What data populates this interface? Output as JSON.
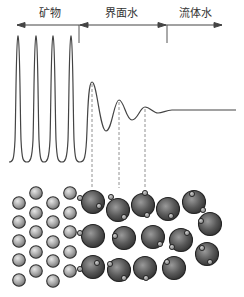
{
  "labels": {
    "mineral": "矿物",
    "interfacial_water": "界面水",
    "fluid_water": "流体水"
  },
  "colors": {
    "line": "#444444",
    "dash": "#777777",
    "small_sphere_fill": "#a9a9a9",
    "large_sphere_fill": "#555555",
    "sphere_outline": "#2a2a2a"
  },
  "arrows": [
    {
      "from": 79,
      "to": 17,
      "y": 25,
      "direction": "left"
    },
    {
      "from": 79,
      "to": 167,
      "y": 25,
      "direction": "left-right-boundary"
    },
    {
      "from": 167,
      "to": 222,
      "y": 25,
      "direction": "right"
    }
  ],
  "dividers": [
    {
      "x": 79,
      "y1": 25,
      "y2": 43
    },
    {
      "x": 167,
      "y1": 25,
      "y2": 43
    }
  ],
  "density_curve": {
    "description": "Density profile: four sharp mineral peaks, then damped oscillation of interfacial water, then flat fluid water",
    "mineral_peaks_x": [
      18,
      36,
      53,
      71
    ],
    "peak_top_y": 36,
    "baseline_y": 162,
    "water_peaks": [
      {
        "x": 92,
        "y": 82
      },
      {
        "x": 119,
        "y": 100
      },
      {
        "x": 145,
        "y": 107
      }
    ],
    "water_troughs": [
      {
        "x": 107,
        "y": 131
      },
      {
        "x": 132,
        "y": 120
      },
      {
        "x": 159,
        "y": 113
      }
    ],
    "flat_y": 110,
    "flat_end_x": 236
  },
  "dashed_guides_x": [
    92,
    119,
    145
  ],
  "small_spheres": [
    {
      "x": 19,
      "y": 203
    },
    {
      "x": 19,
      "y": 222
    },
    {
      "x": 19,
      "y": 241
    },
    {
      "x": 19,
      "y": 260
    },
    {
      "x": 19,
      "y": 280
    },
    {
      "x": 36,
      "y": 193
    },
    {
      "x": 36,
      "y": 213
    },
    {
      "x": 36,
      "y": 232
    },
    {
      "x": 36,
      "y": 252
    },
    {
      "x": 36,
      "y": 271
    },
    {
      "x": 53,
      "y": 203
    },
    {
      "x": 53,
      "y": 222
    },
    {
      "x": 53,
      "y": 242
    },
    {
      "x": 53,
      "y": 261
    },
    {
      "x": 53,
      "y": 281
    },
    {
      "x": 70,
      "y": 193
    },
    {
      "x": 70,
      "y": 213
    },
    {
      "x": 70,
      "y": 232
    },
    {
      "x": 70,
      "y": 252
    },
    {
      "x": 70,
      "y": 271
    }
  ],
  "large_spheres": [
    {
      "x": 93,
      "y": 202,
      "h": [
        [
          80,
          198
        ],
        [
          99,
          206
        ]
      ]
    },
    {
      "x": 118,
      "y": 210,
      "h": [
        [
          111,
          197
        ],
        [
          124,
          217
        ]
      ]
    },
    {
      "x": 143,
      "y": 205,
      "h": [
        [
          145,
          193
        ],
        [
          147,
          215
        ]
      ]
    },
    {
      "x": 168,
      "y": 209,
      "h": [
        [
          171,
          216
        ]
      ]
    },
    {
      "x": 194,
      "y": 202,
      "h": [
        [
          192,
          194
        ],
        [
          203,
          210
        ]
      ]
    },
    {
      "x": 93,
      "y": 236,
      "h": [
        [
          80,
          233
        ]
      ]
    },
    {
      "x": 124,
      "y": 238,
      "h": [
        [
          115,
          236
        ]
      ]
    },
    {
      "x": 153,
      "y": 237,
      "h": [
        [
          160,
          244
        ]
      ]
    },
    {
      "x": 181,
      "y": 240,
      "h": [
        [
          187,
          233
        ],
        [
          172,
          247
        ]
      ]
    },
    {
      "x": 210,
      "y": 224,
      "h": [
        [
          201,
          221
        ]
      ]
    },
    {
      "x": 93,
      "y": 267,
      "h": [
        [
          80,
          269
        ],
        [
          97,
          263
        ]
      ]
    },
    {
      "x": 119,
      "y": 270,
      "h": [
        [
          110,
          264
        ],
        [
          124,
          278
        ]
      ]
    },
    {
      "x": 145,
      "y": 268,
      "h": [
        [
          146,
          278
        ]
      ]
    },
    {
      "x": 174,
      "y": 268,
      "h": [
        [
          167,
          262
        ]
      ]
    },
    {
      "x": 207,
      "y": 254,
      "h": [
        [
          202,
          248
        ],
        [
          210,
          262
        ]
      ]
    }
  ]
}
